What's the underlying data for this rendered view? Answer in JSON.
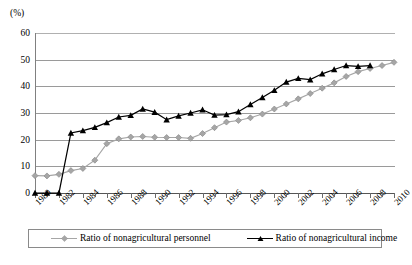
{
  "chart_data": {
    "type": "line",
    "title": "",
    "subtitle": "",
    "unit_label": "(%)",
    "xlabel": "",
    "ylabel": "",
    "ylim": [
      0,
      60
    ],
    "ytick_values": [
      0,
      10,
      20,
      30,
      40,
      50,
      60
    ],
    "ytick_labels": [
      "0",
      "10",
      "20",
      "30",
      "40",
      "50",
      "60"
    ],
    "grid": "horizontal",
    "legend_position": "bottom",
    "xlim": [
      1980,
      2010
    ],
    "x": [
      1980,
      1981,
      1982,
      1983,
      1984,
      1985,
      1986,
      1987,
      1988,
      1989,
      1990,
      1991,
      1992,
      1993,
      1994,
      1995,
      1996,
      1997,
      1998,
      1999,
      2000,
      2001,
      2002,
      2003,
      2004,
      2005,
      2006,
      2007,
      2008,
      2009,
      2010
    ],
    "xtick_labels_shown": [
      "1980",
      "1982",
      "1984",
      "1986",
      "1988",
      "1990",
      "1992",
      "1994",
      "1996",
      "1998",
      "2000",
      "2002",
      "2004",
      "2006",
      "2008",
      "2010"
    ],
    "series": [
      {
        "name": "Ratio of nonagricultural personnel",
        "color": "#a6a6a6",
        "marker": "diamond",
        "values": [
          6.5,
          6.4,
          7.0,
          8.4,
          9.2,
          12.3,
          18.5,
          20.3,
          21.0,
          21.2,
          20.9,
          20.8,
          20.8,
          20.5,
          22.3,
          24.5,
          26.6,
          27.2,
          28.2,
          29.6,
          31.5,
          33.4,
          35.3,
          37.3,
          39.3,
          41.3,
          43.7,
          45.5,
          46.7,
          47.8,
          49.0
        ]
      },
      {
        "name": "Ratio of nonagricultural income",
        "color": "#000000",
        "marker": "triangle",
        "values": [
          0.0,
          0.0,
          0.0,
          22.5,
          23.4,
          24.6,
          26.4,
          28.5,
          29.1,
          31.5,
          30.3,
          27.5,
          28.9,
          30.0,
          31.2,
          29.2,
          29.4,
          30.5,
          33.2,
          35.8,
          38.5,
          41.6,
          43.0,
          42.5,
          44.7,
          46.3,
          47.8,
          47.5,
          47.8,
          null,
          null
        ]
      }
    ]
  },
  "legend": {
    "entries": [
      {
        "label": "Ratio of nonagricultural personnel"
      },
      {
        "label": "Ratio of nonagricultural income"
      }
    ]
  }
}
